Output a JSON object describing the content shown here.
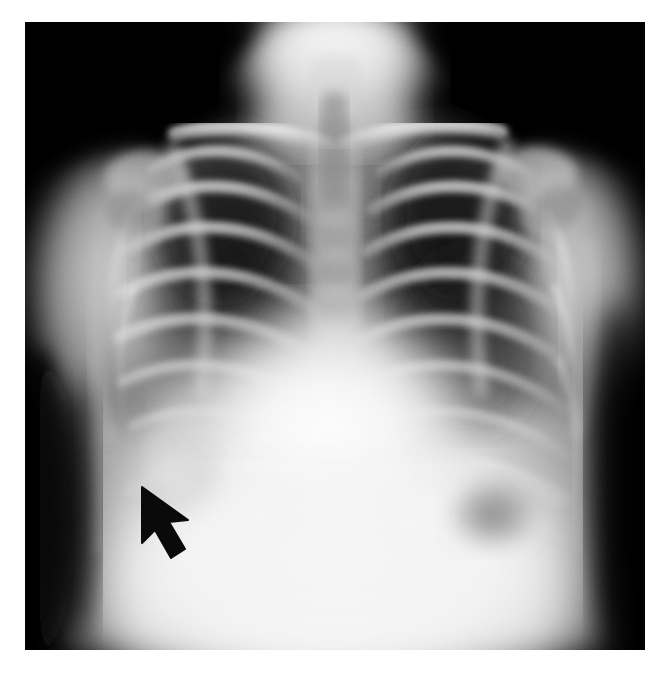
{
  "viewer": {
    "background_color": "#ffffff",
    "image_region": {
      "x": 25,
      "y": 22,
      "width": 620,
      "height": 628
    }
  },
  "image": {
    "kind": "radiograph",
    "modality": "X-ray",
    "projection": "frontal-anteroposterior",
    "body_part": "chest",
    "subject": "pediatric",
    "background_color": "#000000",
    "tone_range": {
      "darkest": "#000000",
      "brightest": "#ffffff"
    },
    "orientation_note": "patient right on image left"
  },
  "annotations": {
    "markers": [
      {
        "name": "arrow-marker",
        "shape": "solid-arrow",
        "color": "#0a0a0a",
        "tip": {
          "x": 142,
          "y": 487
        },
        "tail": {
          "x": 183,
          "y": 546
        },
        "direction": "up-left",
        "points_at": "right-lower-zone-opacity"
      }
    ],
    "labels": [],
    "scale_bar": null,
    "text_overlays": []
  },
  "anatomy": {
    "regions": [
      {
        "name": "neck-soft-tissue",
        "tone": "bright",
        "location": "top-center"
      },
      {
        "name": "trachea",
        "tone": "dark-column",
        "location": "upper-midline"
      },
      {
        "name": "cervicothoracic-spine",
        "tone": "mid-bright",
        "location": "midline"
      },
      {
        "name": "right-clavicle",
        "tone": "bright",
        "location": "upper-left-of-image"
      },
      {
        "name": "left-clavicle",
        "tone": "bright",
        "location": "upper-right-of-image"
      },
      {
        "name": "right-shoulder-humeral-head",
        "tone": "bright",
        "location": "left-edge"
      },
      {
        "name": "left-shoulder-humeral-head",
        "tone": "bright",
        "location": "right-edge"
      },
      {
        "name": "right-lung-field",
        "tone": "dark",
        "location": "image-left"
      },
      {
        "name": "left-lung-field",
        "tone": "dark",
        "location": "image-right"
      },
      {
        "name": "rib-cage",
        "tone": "bright-bands",
        "location": "bilateral"
      },
      {
        "name": "cardiac-silhouette",
        "tone": "very-bright",
        "location": "center-lower"
      },
      {
        "name": "diaphragm",
        "tone": "very-bright",
        "location": "lower"
      },
      {
        "name": "right-lower-zone-opacity",
        "tone": "hazy-bright",
        "location": "arrow-target"
      },
      {
        "name": "gastric-air-bubble",
        "tone": "dark-patch",
        "location": "lower-right-of-image"
      },
      {
        "name": "right-lateral-chest-wall-air",
        "tone": "very-dark",
        "location": "left-edge-lower"
      }
    ]
  }
}
